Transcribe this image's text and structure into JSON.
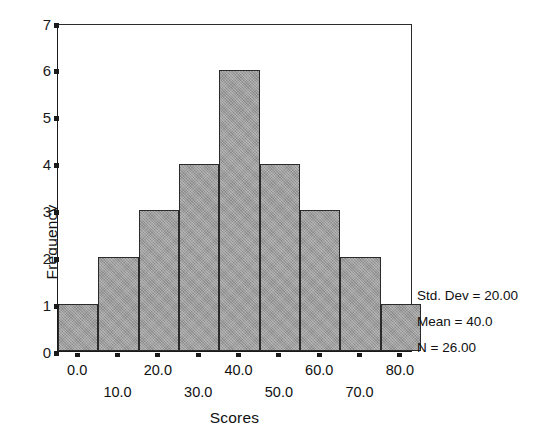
{
  "chart_data": {
    "type": "bar",
    "title": "",
    "subtitle": "",
    "xlabel": "Scores",
    "ylabel": "Frequency",
    "categories": [
      "0.0",
      "10.0",
      "20.0",
      "30.0",
      "40.0",
      "50.0",
      "60.0",
      "70.0",
      "80.0"
    ],
    "x": [
      0,
      10,
      20,
      30,
      40,
      50,
      60,
      70,
      80
    ],
    "values": [
      1,
      2,
      3,
      4,
      6,
      4,
      3,
      2,
      1
    ],
    "bin_width": 10,
    "xlim": [
      -5,
      83
    ],
    "ylim": [
      0,
      7
    ],
    "ytick_labels": [
      "0",
      "1",
      "2",
      "3",
      "4",
      "5",
      "6",
      "7"
    ],
    "ytick_values": [
      0,
      1,
      2,
      3,
      4,
      5,
      6,
      7
    ],
    "xtick_labels_upper": [
      "0.0",
      "20.0",
      "40.0",
      "60.0",
      "80.0"
    ],
    "xtick_labels_lower": [
      "10.0",
      "30.0",
      "50.0",
      "70.0"
    ],
    "grid": false,
    "legend": "none",
    "bar_fill_color": "#9b9b9b",
    "bar_edge_color": "#2a2a2a",
    "background_color": "#ffffff",
    "axis_color": "#1a1a1a"
  },
  "annotations": {
    "std_dev": "Std. Dev = 20.00",
    "mean": "Mean = 40.0",
    "n": "N = 26.00"
  }
}
